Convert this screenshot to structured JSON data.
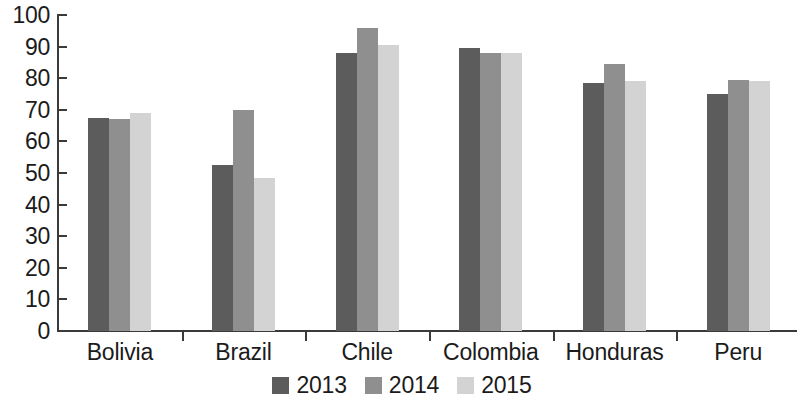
{
  "chart_data": {
    "type": "bar",
    "title": "",
    "subtitle": "",
    "xlabel": "",
    "ylabel": "",
    "ylim": [
      0,
      100
    ],
    "ytick_step": 10,
    "yticks": [
      "0",
      "10",
      "20",
      "30",
      "40",
      "50",
      "60",
      "70",
      "80",
      "90",
      "100"
    ],
    "grid": false,
    "legend_position": "bottom-center",
    "categories": [
      "Bolivia",
      "Brazil",
      "Chile",
      "Colombia",
      "Honduras",
      "Peru"
    ],
    "series": [
      {
        "name": "2013",
        "color": "#5c5c5c",
        "values": [
          67.4,
          52.5,
          88.0,
          89.5,
          78.5,
          75.0
        ]
      },
      {
        "name": "2014",
        "color": "#8f8f8f",
        "values": [
          67.0,
          70.0,
          96.0,
          88.0,
          84.5,
          79.5
        ]
      },
      {
        "name": "2015",
        "color": "#d3d3d3",
        "values": [
          69.0,
          48.5,
          90.5,
          88.0,
          79.0,
          79.0
        ]
      }
    ]
  },
  "legend": {
    "items": [
      {
        "label": "2013",
        "color": "#5c5c5c"
      },
      {
        "label": "2014",
        "color": "#8f8f8f"
      },
      {
        "label": "2015",
        "color": "#d3d3d3"
      }
    ]
  },
  "axes": {
    "y_axis_color": "#3a3a3a",
    "x_axis_color": "#3a3a3a",
    "text_color": "#1b1b1b"
  }
}
